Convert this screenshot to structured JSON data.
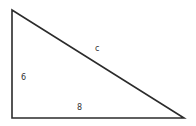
{
  "diagram": {
    "type": "right-triangle",
    "vertices": {
      "top": [
        12,
        10
      ],
      "right_angle": [
        12,
        118
      ],
      "right": [
        184,
        118
      ]
    },
    "stroke_color": "#2b2b2b",
    "labels": {
      "hypotenuse": "c",
      "vertical_leg": "6",
      "horizontal_leg": "8"
    }
  }
}
